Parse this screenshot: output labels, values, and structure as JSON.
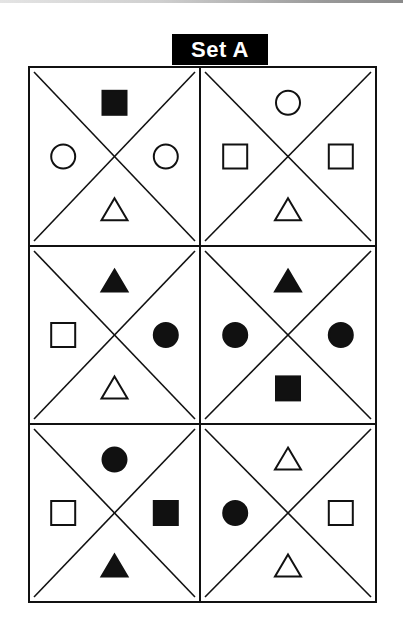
{
  "title": "Set A",
  "colors": {
    "ink": "#111111",
    "paper": "#ffffff",
    "label_bg": "#000000",
    "label_text": "#ffffff"
  },
  "grid": {
    "rows": 3,
    "cols": 2,
    "cells": [
      {
        "row": 0,
        "col": 0,
        "top": {
          "shape": "square",
          "fill": "filled"
        },
        "left": {
          "shape": "circle",
          "fill": "open"
        },
        "right": {
          "shape": "circle",
          "fill": "open"
        },
        "bottom": {
          "shape": "triangle",
          "fill": "open"
        }
      },
      {
        "row": 0,
        "col": 1,
        "top": {
          "shape": "circle",
          "fill": "open"
        },
        "left": {
          "shape": "square",
          "fill": "open"
        },
        "right": {
          "shape": "square",
          "fill": "open"
        },
        "bottom": {
          "shape": "triangle",
          "fill": "open"
        }
      },
      {
        "row": 1,
        "col": 0,
        "top": {
          "shape": "triangle",
          "fill": "filled"
        },
        "left": {
          "shape": "square",
          "fill": "open"
        },
        "right": {
          "shape": "circle",
          "fill": "filled"
        },
        "bottom": {
          "shape": "triangle",
          "fill": "open"
        }
      },
      {
        "row": 1,
        "col": 1,
        "top": {
          "shape": "triangle",
          "fill": "filled"
        },
        "left": {
          "shape": "circle",
          "fill": "filled"
        },
        "right": {
          "shape": "circle",
          "fill": "filled"
        },
        "bottom": {
          "shape": "square",
          "fill": "filled"
        }
      },
      {
        "row": 2,
        "col": 0,
        "top": {
          "shape": "circle",
          "fill": "filled"
        },
        "left": {
          "shape": "square",
          "fill": "open"
        },
        "right": {
          "shape": "square",
          "fill": "filled"
        },
        "bottom": {
          "shape": "triangle",
          "fill": "filled"
        }
      },
      {
        "row": 2,
        "col": 1,
        "top": {
          "shape": "triangle",
          "fill": "open"
        },
        "left": {
          "shape": "circle",
          "fill": "filled"
        },
        "right": {
          "shape": "square",
          "fill": "open"
        },
        "bottom": {
          "shape": "triangle",
          "fill": "open"
        }
      }
    ]
  }
}
